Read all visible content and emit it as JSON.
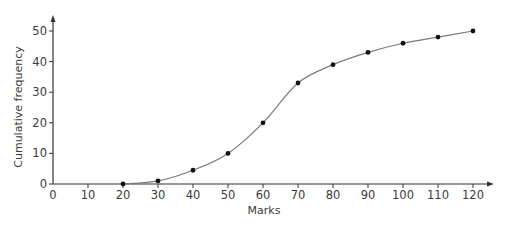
{
  "chart_data": {
    "type": "line",
    "title": "",
    "xlabel": "Marks",
    "ylabel": "Cumulative frequency",
    "xlim": [
      0,
      125
    ],
    "ylim": [
      0,
      54
    ],
    "x_ticks": [
      0,
      10,
      20,
      30,
      40,
      50,
      60,
      70,
      80,
      90,
      100,
      110,
      120
    ],
    "y_ticks": [
      0,
      10,
      20,
      30,
      40,
      50
    ],
    "grid": false,
    "legend": null,
    "series": [
      {
        "name": "Cumulative frequency",
        "style": "smooth curve with point markers",
        "x": [
          20,
          30,
          40,
          50,
          60,
          70,
          80,
          90,
          100,
          110,
          120
        ],
        "y": [
          0,
          1,
          4.5,
          10,
          20,
          33,
          39,
          43,
          46,
          48,
          50
        ]
      }
    ]
  },
  "colors": {
    "axis": "#333333",
    "curve": "#7a7a7a",
    "marker": "#111111",
    "text": "#3a3a3a"
  }
}
